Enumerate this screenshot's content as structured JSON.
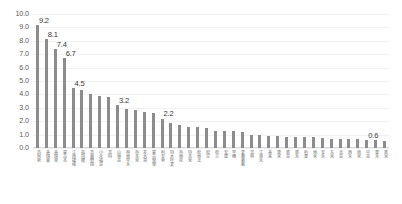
{
  "chart_data": {
    "type": "bar",
    "title": "",
    "subtitle": "",
    "xlabel": "",
    "ylabel": "",
    "ylim": [
      0.0,
      10.0
    ],
    "ytick_step": 1.0,
    "grid": true,
    "legend": "none",
    "bar_color": "#8c8c8c",
    "gridline_color": "#f1f1f3",
    "axis_color": "#d9d9dd",
    "label_color": "#3a3a3a",
    "tick_color": "#5a5a5a",
    "yticks": [
      "10.0",
      "9.0",
      "8.0",
      "7.0",
      "6.0",
      "5.0",
      "4.0",
      "3.0",
      "2.0",
      "1.0",
      "0.0"
    ],
    "categories": [
      "苏阿斯",
      "美国莱",
      "美国单",
      "蒙古本",
      "江西捷秧",
      "指特稷",
      "高面野国",
      "小禾福苗",
      "高科",
      "山地苗",
      "林地早禾",
      "热本米",
      "发大哥",
      "蒙古黎黎",
      "利安索",
      "特大叶麦",
      "热地花",
      "特本米",
      "松地法",
      "松甘",
      "松兰",
      "安建",
      "早穗",
      "麦教教教",
      "滨林",
      "江单禾",
      "美来",
      "果米",
      "新苗",
      "新禾",
      "利果",
      "地米",
      "安禾",
      "东米",
      "北苗",
      "西禾",
      "南米",
      "中苗",
      "果禾",
      "新米"
    ],
    "values": [
      9.2,
      8.1,
      7.4,
      6.7,
      4.5,
      4.3,
      4.0,
      3.9,
      3.8,
      3.2,
      2.9,
      2.8,
      2.7,
      2.6,
      2.2,
      1.9,
      1.7,
      1.6,
      1.55,
      1.5,
      1.3,
      1.3,
      1.25,
      1.2,
      1.0,
      0.95,
      0.9,
      0.9,
      0.85,
      0.85,
      0.8,
      0.8,
      0.75,
      0.7,
      0.7,
      0.65,
      0.65,
      0.6,
      0.6,
      0.55
    ],
    "labeled_points": [
      {
        "index": 0,
        "value": "9.2"
      },
      {
        "index": 1,
        "value": "8.1"
      },
      {
        "index": 2,
        "value": "7.4"
      },
      {
        "index": 3,
        "value": "6.7"
      },
      {
        "index": 4,
        "value": "4.5"
      },
      {
        "index": 9,
        "value": "3.2"
      },
      {
        "index": 14,
        "value": "2.2"
      },
      {
        "index": 37,
        "value": "0.6"
      }
    ]
  }
}
